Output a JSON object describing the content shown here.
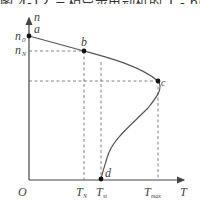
{
  "caption": "图 4-12 三相异步电动机的 T - n(s) 曲线",
  "axes": {
    "y_label": "n",
    "x_label": "T",
    "origin": "O"
  },
  "y_ticks": {
    "n0": "n",
    "n0_sub": "0",
    "nN": "n",
    "nN_sub": "N"
  },
  "x_ticks": {
    "TN": "T",
    "TN_sub": "N",
    "Tst": "T",
    "Tst_sub": "st",
    "Tmax": "T",
    "Tmax_sub": "max"
  },
  "points": {
    "a": "a",
    "b": "b",
    "c": "c",
    "d": "d"
  },
  "colors": {
    "curve": "#555555",
    "axis": "#444444",
    "dash": "#666666",
    "point": "#111111"
  }
}
